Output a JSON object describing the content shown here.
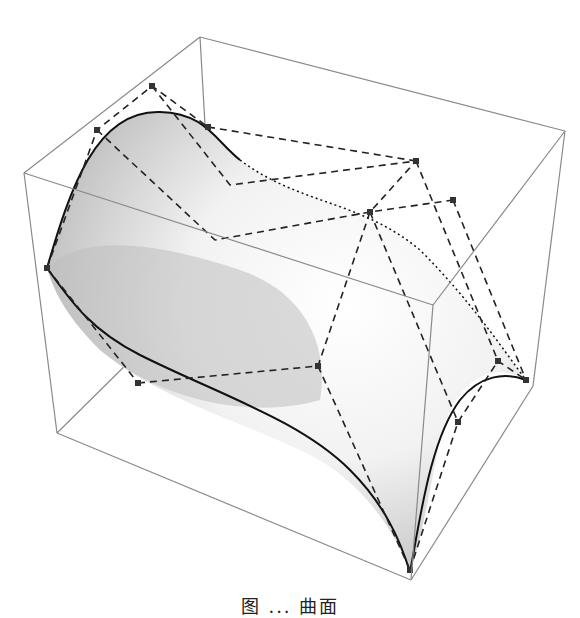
{
  "figure": {
    "type": "bezier-surface-3d-plot",
    "caption": "图 ... 曲面",
    "colors": {
      "background": "#ffffff",
      "bounding_box": "#7a7a7a",
      "control_polygon": "#222222",
      "control_point": "#3a3a3a",
      "surface_edge": "#1a1a1a",
      "surface_light": "#ffffff",
      "surface_dark": "#9a9a9a"
    },
    "bounding_box": {
      "vertices": {
        "top_back_left": [
          24,
          173
        ],
        "top_back_right": [
          200,
          37
        ],
        "top_far_right": [
          565,
          131
        ],
        "top_front_right": [
          433,
          305
        ],
        "bottom_back_left": [
          57,
          433
        ],
        "bottom_front": [
          411,
          580
        ],
        "bottom_far_right": [
          533,
          386
        ],
        "bottom_back_mid": [
          143,
          348
        ]
      }
    },
    "control_points": [
      {
        "id": "P00",
        "x": 47,
        "y": 268
      },
      {
        "id": "P01",
        "x": 97,
        "y": 130
      },
      {
        "id": "P02",
        "x": 152,
        "y": 86
      },
      {
        "id": "P03",
        "x": 208,
        "y": 127
      },
      {
        "id": "P10",
        "x": 138,
        "y": 383
      },
      {
        "id": "P11",
        "x": 318,
        "y": 366
      },
      {
        "id": "P12",
        "x": 370,
        "y": 212
      },
      {
        "id": "P13",
        "x": 416,
        "y": 161
      },
      {
        "id": "P20",
        "x": 410,
        "y": 570
      },
      {
        "id": "P21",
        "x": 458,
        "y": 422
      },
      {
        "id": "P22",
        "x": 498,
        "y": 361
      },
      {
        "id": "P23",
        "x": 526,
        "y": 380
      },
      {
        "id": "P30",
        "x": 453,
        "y": 200
      }
    ]
  }
}
